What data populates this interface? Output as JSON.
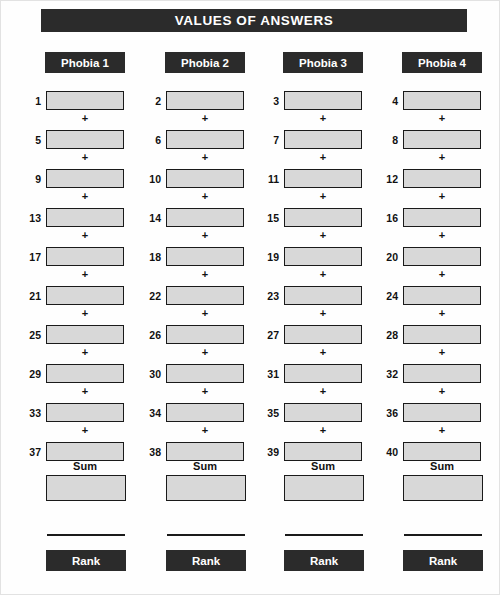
{
  "page": {
    "title": "VALUES OF ANSWERS",
    "background_color": "#fefefe",
    "ink_color": "#1a1a1a",
    "header_fill": "#2b2b2b",
    "box_fill": "#d8d8d8"
  },
  "labels": {
    "plus": "+",
    "sum": "Sum",
    "rank": "Rank"
  },
  "columns": [
    {
      "header": "Phobia 1",
      "item_numbers": [
        "1",
        "5",
        "9",
        "13",
        "17",
        "21",
        "25",
        "29",
        "33",
        "37"
      ],
      "sum_label": "Sum",
      "sum_value": "",
      "rank_label": "Rank",
      "rank_value": ""
    },
    {
      "header": "Phobia 2",
      "item_numbers": [
        "2",
        "6",
        "10",
        "14",
        "18",
        "22",
        "26",
        "30",
        "34",
        "38"
      ],
      "sum_label": "Sum",
      "sum_value": "",
      "rank_label": "Rank",
      "rank_value": ""
    },
    {
      "header": "Phobia 3",
      "item_numbers": [
        "3",
        "7",
        "11",
        "15",
        "19",
        "23",
        "27",
        "31",
        "35",
        "39"
      ],
      "sum_label": "Sum",
      "sum_value": "",
      "rank_label": "Rank",
      "rank_value": ""
    },
    {
      "header": "Phobia 4",
      "item_numbers": [
        "4",
        "8",
        "12",
        "16",
        "20",
        "24",
        "28",
        "32",
        "36",
        "40"
      ],
      "sum_label": "Sum",
      "sum_value": "",
      "rank_label": "Rank",
      "rank_value": ""
    }
  ]
}
